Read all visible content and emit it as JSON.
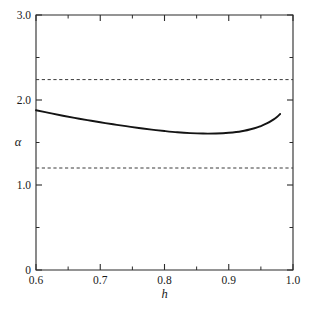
{
  "chart_data": {
    "type": "line",
    "title": "",
    "xlabel": "h",
    "ylabel": "α",
    "xlim": [
      0.6,
      1.0
    ],
    "ylim": [
      0.0,
      3.0
    ],
    "grid": false,
    "legend": "none",
    "x_ticks_major": [
      "0.6",
      "0.7",
      "0.8",
      "0.9",
      "1.0"
    ],
    "x_ticks_major_values": [
      0.6,
      0.7,
      0.8,
      0.9,
      1.0
    ],
    "x_ticks_minor_values": [
      0.65,
      0.75,
      0.85,
      0.95
    ],
    "y_ticks_major": [
      "0",
      "1.0",
      "2.0",
      "3.0"
    ],
    "y_ticks_major_values": [
      0.0,
      1.0,
      2.0,
      3.0
    ],
    "y_ticks_minor_values": [
      0.5,
      1.5,
      2.5
    ],
    "series": [
      {
        "name": "alpha-curve",
        "style": "solid",
        "color": "#141414",
        "x": [
          0.6,
          0.62,
          0.64,
          0.66,
          0.68,
          0.7,
          0.72,
          0.74,
          0.76,
          0.78,
          0.8,
          0.82,
          0.84,
          0.86,
          0.88,
          0.9,
          0.92,
          0.94,
          0.95,
          0.96,
          0.97,
          0.975,
          0.98
        ],
        "y": [
          1.88,
          1.848,
          1.818,
          1.79,
          1.763,
          1.738,
          1.714,
          1.692,
          1.671,
          1.652,
          1.635,
          1.62,
          1.61,
          1.605,
          1.606,
          1.614,
          1.632,
          1.668,
          1.694,
          1.727,
          1.772,
          1.8,
          1.836
        ]
      },
      {
        "name": "upper-reference-line",
        "style": "dashed",
        "color": "#3a3a3a",
        "y_constant": 2.24
      },
      {
        "name": "lower-reference-line",
        "style": "dashed",
        "color": "#3a3a3a",
        "y_constant": 1.2
      }
    ],
    "annotations": []
  },
  "figure": {
    "background": "#ffffff",
    "frame_color": "#2b2b2b"
  }
}
